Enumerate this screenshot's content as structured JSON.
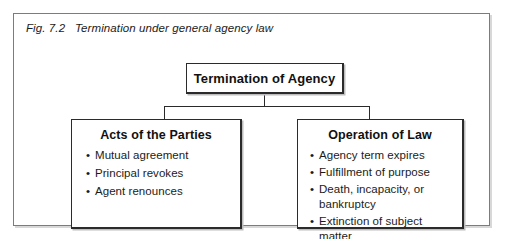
{
  "figure": {
    "caption": "Fig. 7.2   Termination under general agency law",
    "frame_border_color": "#7c7c7c",
    "box_border_color": "#2b2b2b",
    "text_color": "#1b1b1b"
  },
  "diagram": {
    "type": "hierarchy",
    "root": {
      "title": "Termination of Agency"
    },
    "branches": [
      {
        "title": "Acts of the Parties",
        "bullet_char": "•",
        "items": [
          "Mutual  agreement",
          "Principal  revokes",
          "Agent  renounces"
        ]
      },
      {
        "title": "Operation of Law",
        "bullet_char": "•",
        "items": [
          "Agency term expires",
          "Fulfillment  of  purpose",
          "Death, incapacity, or bankruptcy",
          "Extinction of subject matter"
        ]
      }
    ]
  }
}
